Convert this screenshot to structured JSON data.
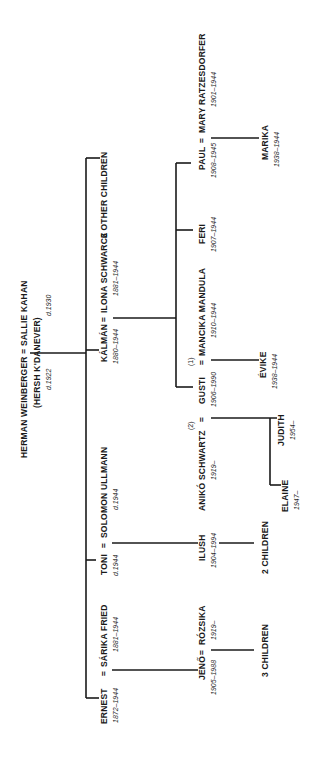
{
  "orientation": "rotated 90° counter-clockwise (text reads bottom-to-top)",
  "line_color": "#1a1a1a",
  "generation1": {
    "couple": "HERMAN WEINBERGER = SALLIE KAHAN",
    "husband": {
      "name": "HERMAN WEINBERGER",
      "alias": "(HERSH K'DANEVER)",
      "dates": "d.1922"
    },
    "wife": {
      "name": "SALLIE KAHAN",
      "dates": "d.1930"
    }
  },
  "generation2": [
    {
      "name": "ERNEST",
      "dates": "1872–1944",
      "spouse": "SÁRIKA FRIED",
      "spouse_dates": "1881–1944"
    },
    {
      "name": "TONI",
      "dates": "d.1944",
      "spouse": "SOLOMON ULLMANN",
      "spouse_dates": "d.1944"
    },
    {
      "name": "KÁLMÁN",
      "dates": "1880–1944",
      "spouse": "ILONA SCHWARCZ",
      "spouse_dates": "1881–1944"
    },
    {
      "name": "6 OTHER CHILDREN"
    }
  ],
  "generation3": {
    "jeno": {
      "name": "JENŐ",
      "dates": "1905–1988",
      "spouse": "RÓZSIKA",
      "spouse_dates": "1919–",
      "children": "3 CHILDREN"
    },
    "ilush": {
      "name": "ILUSH",
      "dates": "1904–1994",
      "children": "2 CHILDREN"
    },
    "gusti": {
      "name": "GUSTI",
      "dates": "1906–1990",
      "spouse2": {
        "marker": "(2)",
        "name": "ANIKÓ SCHWARTZ",
        "dates": "1919–"
      },
      "spouse1": {
        "marker": "(1)",
        "name": "MANCIKA MANDULA",
        "dates": "1910–1944"
      }
    },
    "feri": {
      "name": "FERI",
      "dates": "1907–1944"
    },
    "paul": {
      "name": "PAUL",
      "dates": "1908–1945",
      "spouse": "MARY RATZESDORFER",
      "spouse_dates": "1901–1944"
    }
  },
  "generation4": {
    "elaine": {
      "name": "ELAINE",
      "dates": "1947–"
    },
    "judith": {
      "name": "JUDITH",
      "dates": "1954–"
    },
    "evike": {
      "name": "ÉVIKE",
      "dates": "1938–1944"
    },
    "marika": {
      "name": "MARIKA",
      "dates": "1938–1944"
    }
  },
  "marriage_symbol": "="
}
